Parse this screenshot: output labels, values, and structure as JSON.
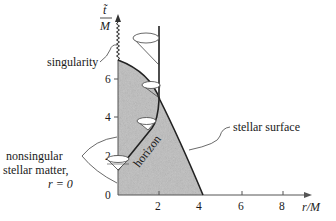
{
  "diagram": {
    "type": "spacetime-diagram",
    "axes": {
      "y_label_top": "t̃",
      "y_label_bottom": "M",
      "x_label": "r/M",
      "x_ticks": [
        "2",
        "4",
        "6",
        "8"
      ],
      "y_ticks": [
        "0",
        "2",
        "4",
        "6"
      ]
    },
    "labels": {
      "singularity": "singularity",
      "stellar_surface": "stellar surface",
      "horizon": "horizon",
      "matter_line1": "nonsingular",
      "matter_line2": "stellar matter,",
      "matter_line3": "r = 0"
    },
    "colors": {
      "star_fill": "#bdbdbd",
      "line": "#222222",
      "axis": "#555555"
    }
  }
}
